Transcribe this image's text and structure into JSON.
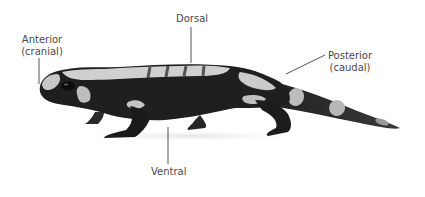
{
  "figure": {
    "labels": {
      "anterior": {
        "line1": "Anterior",
        "line2": "(cranial)"
      },
      "dorsal": {
        "text": "Dorsal"
      },
      "posterior": {
        "line1": "Posterior",
        "line2": "(caudal)"
      },
      "ventral": {
        "text": "Ventral"
      }
    },
    "colors": {
      "background": "#ffffff",
      "label_text": "#4a4a4a",
      "leader_line": "#555555",
      "body_dark": "#1c1c1c",
      "body_light": "#cfcfcf"
    }
  }
}
